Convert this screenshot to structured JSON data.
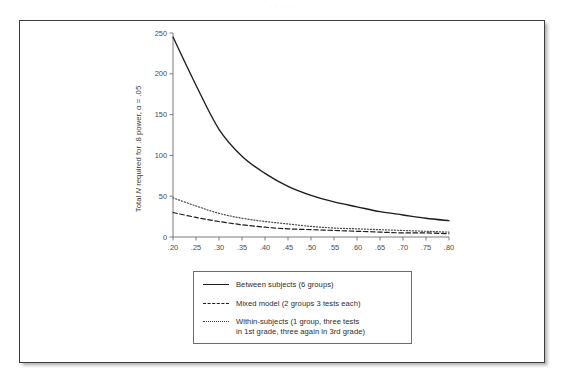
{
  "page": {
    "header_faint_text": "· · · · ·"
  },
  "figure": {
    "y_axis_title_prefix": "Total ",
    "y_axis_title_italic": "N",
    "y_axis_title_suffix": " required for .8 power, α = .05"
  },
  "legend": {
    "position": "inside-bottom-left",
    "entries": [
      {
        "style": "solid",
        "label": "Between subjects (6 groups)"
      },
      {
        "style": "dashed",
        "label": "Mixed model (2 groups 3 tests each)"
      },
      {
        "style": "dotted",
        "label": "Within-subjects (1 group, three tests\nin 1st grade, three again in 3rd grade)"
      }
    ]
  },
  "chart_data": {
    "type": "line",
    "title": "",
    "subtitle": "",
    "xlabel": "",
    "ylabel": "Total N required for .8 power, α = .05",
    "xlim": [
      0.2,
      0.8
    ],
    "ylim": [
      0,
      250
    ],
    "grid": false,
    "legend_position": "inside-bottom-left",
    "x": [
      0.2,
      0.25,
      0.3,
      0.35,
      0.4,
      0.45,
      0.5,
      0.55,
      0.6,
      0.65,
      0.7,
      0.75,
      0.8
    ],
    "xticklabels": [
      ".20",
      ".25",
      ".30",
      ".35",
      ".40",
      ".45",
      ".50",
      ".55",
      ".60",
      ".65",
      ".70",
      ".75",
      ".80"
    ],
    "yticks": [
      0,
      50,
      100,
      150,
      200,
      250
    ],
    "yticklabels": [
      "0",
      "50",
      "100",
      "150",
      "200",
      "250"
    ],
    "series": [
      {
        "name": "Between subjects (6 groups)",
        "style": "solid",
        "color": "#1c1c1c",
        "values": [
          245,
          186,
          132,
          99,
          78,
          62,
          51,
          43,
          37,
          31,
          27,
          23,
          20
        ]
      },
      {
        "name": "Within-subjects (1 group, three tests in 1st grade, three again in 3rd grade)",
        "style": "dotted",
        "color": "#4a4a4a",
        "values": [
          48,
          38,
          29,
          23,
          19,
          16,
          13,
          11,
          10,
          9,
          8,
          7,
          6
        ]
      },
      {
        "name": "Mixed model (2 groups 3 tests each)",
        "style": "dashed",
        "color": "#1c1c1c",
        "values": [
          30,
          24,
          19,
          15,
          12,
          10,
          9,
          8,
          7,
          6,
          5,
          5,
          4
        ]
      }
    ]
  }
}
